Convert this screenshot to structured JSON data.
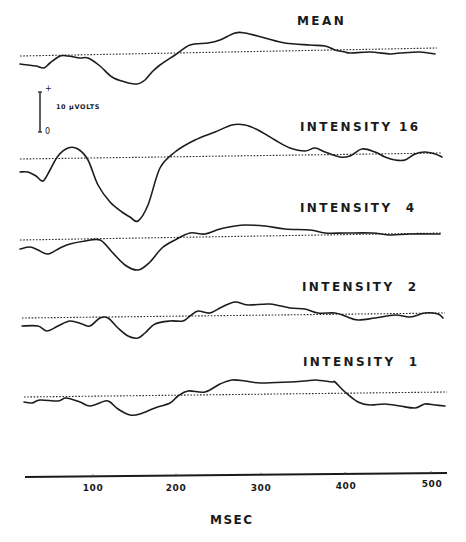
{
  "chart_data": {
    "type": "line",
    "title": "",
    "xlabel": "MSEC",
    "ylabel": "",
    "xlim": [
      0,
      520
    ],
    "x_ticks": [
      100,
      200,
      300,
      400,
      500
    ],
    "x_tick_labels": [
      "100",
      "200",
      "300",
      "400",
      "500"
    ],
    "grid": false,
    "legend": "none (each trace labelled inline above its right end)",
    "scale_bar": {
      "label": "10 µVOLTS",
      "top_symbol": "+",
      "bottom_symbol": "0"
    },
    "units": {
      "x": "msec",
      "y": "µV (relative, each trace offset vertically with its own dotted baseline)"
    },
    "series": [
      {
        "name": "MEAN",
        "baseline_px": [
          [
            20,
            56
          ],
          [
            437,
            48
          ]
        ],
        "points_px": [
          [
            20,
            64
          ],
          [
            28,
            65
          ],
          [
            36,
            66
          ],
          [
            44,
            68
          ],
          [
            50,
            63
          ],
          [
            60,
            56
          ],
          [
            68,
            56
          ],
          [
            80,
            58
          ],
          [
            88,
            58
          ],
          [
            100,
            66
          ],
          [
            112,
            77
          ],
          [
            125,
            82
          ],
          [
            137,
            84
          ],
          [
            145,
            80
          ],
          [
            152,
            72
          ],
          [
            160,
            65
          ],
          [
            175,
            55
          ],
          [
            190,
            45
          ],
          [
            208,
            43
          ],
          [
            220,
            40
          ],
          [
            235,
            33
          ],
          [
            245,
            33
          ],
          [
            265,
            38
          ],
          [
            285,
            43
          ],
          [
            310,
            45
          ],
          [
            325,
            46
          ],
          [
            335,
            50
          ],
          [
            345,
            52
          ],
          [
            350,
            53
          ],
          [
            370,
            52
          ],
          [
            390,
            54
          ],
          [
            400,
            53
          ],
          [
            420,
            52
          ],
          [
            435,
            54
          ]
        ],
        "approx_values_uv": {
          "N150": -7,
          "P270": 5
        }
      },
      {
        "name": "INTENSITY 16",
        "baseline_px": [
          [
            20,
            159
          ],
          [
            442,
            153
          ]
        ],
        "points_px": [
          [
            20,
            172
          ],
          [
            28,
            172
          ],
          [
            36,
            176
          ],
          [
            43,
            181
          ],
          [
            50,
            170
          ],
          [
            58,
            156
          ],
          [
            68,
            148
          ],
          [
            78,
            149
          ],
          [
            88,
            160
          ],
          [
            98,
            185
          ],
          [
            110,
            202
          ],
          [
            122,
            212
          ],
          [
            130,
            217
          ],
          [
            138,
            221
          ],
          [
            148,
            205
          ],
          [
            160,
            168
          ],
          [
            175,
            152
          ],
          [
            195,
            140
          ],
          [
            215,
            132
          ],
          [
            232,
            125
          ],
          [
            245,
            125
          ],
          [
            258,
            130
          ],
          [
            275,
            140
          ],
          [
            290,
            148
          ],
          [
            305,
            151
          ],
          [
            315,
            148
          ],
          [
            325,
            152
          ],
          [
            340,
            157
          ],
          [
            350,
            156
          ],
          [
            362,
            149
          ],
          [
            375,
            152
          ],
          [
            385,
            157
          ],
          [
            395,
            160
          ],
          [
            405,
            160
          ],
          [
            415,
            154
          ],
          [
            425,
            152
          ],
          [
            435,
            154
          ],
          [
            442,
            157
          ]
        ],
        "approx_values_uv": {
          "P60": 3,
          "N150": -15,
          "P270": 8
        }
      },
      {
        "name": "INTENSITY 4",
        "baseline_px": [
          [
            20,
            240
          ],
          [
            442,
            233
          ]
        ],
        "points_px": [
          [
            20,
            249
          ],
          [
            30,
            247
          ],
          [
            38,
            250
          ],
          [
            48,
            254
          ],
          [
            60,
            248
          ],
          [
            70,
            244
          ],
          [
            85,
            241
          ],
          [
            100,
            240
          ],
          [
            112,
            252
          ],
          [
            125,
            265
          ],
          [
            138,
            270
          ],
          [
            150,
            262
          ],
          [
            162,
            248
          ],
          [
            175,
            240
          ],
          [
            190,
            233
          ],
          [
            205,
            234
          ],
          [
            220,
            229
          ],
          [
            235,
            226
          ],
          [
            245,
            225
          ],
          [
            265,
            226
          ],
          [
            285,
            229
          ],
          [
            310,
            230
          ],
          [
            325,
            233
          ],
          [
            345,
            233
          ],
          [
            372,
            233
          ],
          [
            390,
            235
          ],
          [
            410,
            234
          ],
          [
            440,
            234
          ]
        ],
        "approx_values_uv": {
          "N150": -7,
          "P270": 3
        }
      },
      {
        "name": "INTENSITY 2",
        "baseline_px": [
          [
            22,
            318
          ],
          [
            445,
            313
          ]
        ],
        "points_px": [
          [
            22,
            326
          ],
          [
            38,
            326
          ],
          [
            47,
            331
          ],
          [
            58,
            326
          ],
          [
            70,
            321
          ],
          [
            82,
            324
          ],
          [
            90,
            326
          ],
          [
            100,
            318
          ],
          [
            108,
            318
          ],
          [
            118,
            328
          ],
          [
            128,
            336
          ],
          [
            138,
            338
          ],
          [
            145,
            333
          ],
          [
            155,
            324
          ],
          [
            170,
            321
          ],
          [
            183,
            321
          ],
          [
            190,
            316
          ],
          [
            198,
            311
          ],
          [
            210,
            313
          ],
          [
            222,
            307
          ],
          [
            235,
            302
          ],
          [
            248,
            305
          ],
          [
            270,
            304
          ],
          [
            290,
            308
          ],
          [
            305,
            309
          ],
          [
            318,
            313
          ],
          [
            335,
            313
          ],
          [
            345,
            316
          ],
          [
            358,
            320
          ],
          [
            375,
            318
          ],
          [
            395,
            315
          ],
          [
            410,
            317
          ],
          [
            425,
            313
          ],
          [
            438,
            314
          ],
          [
            443,
            318
          ]
        ],
        "approx_values_uv": {
          "N150": -5,
          "P270": 4
        }
      },
      {
        "name": "INTENSITY 1",
        "baseline_px": [
          [
            24,
            397
          ],
          [
            447,
            392
          ]
        ],
        "points_px": [
          [
            24,
            402
          ],
          [
            32,
            403
          ],
          [
            40,
            400
          ],
          [
            58,
            401
          ],
          [
            66,
            398
          ],
          [
            80,
            402
          ],
          [
            90,
            406
          ],
          [
            105,
            401
          ],
          [
            110,
            402
          ],
          [
            118,
            409
          ],
          [
            130,
            415
          ],
          [
            140,
            414
          ],
          [
            155,
            408
          ],
          [
            170,
            403
          ],
          [
            178,
            396
          ],
          [
            188,
            391
          ],
          [
            205,
            392
          ],
          [
            220,
            384
          ],
          [
            232,
            380
          ],
          [
            245,
            381
          ],
          [
            260,
            383
          ],
          [
            290,
            382
          ],
          [
            305,
            381
          ],
          [
            316,
            380
          ],
          [
            332,
            382
          ],
          [
            335,
            382
          ],
          [
            345,
            392
          ],
          [
            358,
            402
          ],
          [
            370,
            405
          ],
          [
            385,
            404
          ],
          [
            400,
            406
          ],
          [
            415,
            408
          ],
          [
            425,
            404
          ],
          [
            435,
            405
          ],
          [
            445,
            406
          ]
        ],
        "approx_values_uv": {
          "N150": -4,
          "P300": 4
        }
      }
    ]
  },
  "labels": {
    "mean": "MEAN",
    "intensity16": "INTENSITY 16",
    "intensity4": "INTENSITY  4",
    "intensity2": "INTENSITY  2",
    "intensity1": "INTENSITY  1",
    "scale_value": "10 µVOLTS",
    "scale_plus": "+",
    "scale_zero": "0",
    "xlabel": "MSEC",
    "ticks": [
      "100",
      "200",
      "300",
      "400",
      "500"
    ]
  },
  "axis_px": {
    "line": [
      [
        25,
        477
      ],
      [
        447,
        473
      ]
    ],
    "ticks_x": [
      93,
      176,
      261,
      345,
      431
    ]
  }
}
